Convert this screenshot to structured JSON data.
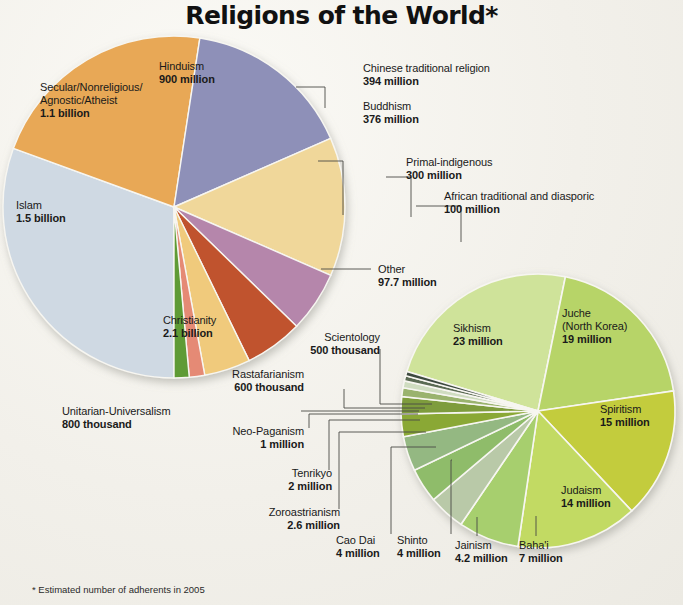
{
  "title": "Religions of the World*",
  "footnote": "* Estimated number of adherents in 2005",
  "chart_data": {
    "type": "pie",
    "title": "Religions of the World*",
    "subtitle": "* Estimated number of adherents in 2005",
    "unit": "adherents",
    "legend_position": "labels-on-slices-and-callouts",
    "charts": [
      {
        "name": "main-pie",
        "slices": [
          {
            "label": "Christianity",
            "value_text": "2.1 billion",
            "value": 2100000000,
            "color": "#cfd9e3"
          },
          {
            "label": "Islam",
            "value_text": "1.5 billion",
            "value": 1500000000,
            "color": "#e8a857"
          },
          {
            "label": "Secular/Nonreligious/Agnostic/Atheist",
            "value_text": "1.1 billion",
            "value": 1100000000,
            "color": "#8e90b8"
          },
          {
            "label": "Hinduism",
            "value_text": "900 million",
            "value": 900000000,
            "color": "#f0d79a"
          },
          {
            "label": "Chinese traditional religion",
            "value_text": "394 million",
            "value": 394000000,
            "color": "#b586ab"
          },
          {
            "label": "Buddhism",
            "value_text": "376 million",
            "value": 376000000,
            "color": "#c0522f"
          },
          {
            "label": "Primal-indigenous",
            "value_text": "300 million",
            "value": 300000000,
            "color": "#f0ca7c"
          },
          {
            "label": "African traditional and diasporic",
            "value_text": "100 million",
            "value": 100000000,
            "color": "#e58a75"
          },
          {
            "label": "Other",
            "value_text": "97.7 million",
            "value": 97700000,
            "color": "#5f9b34"
          }
        ]
      },
      {
        "name": "other-detail-pie",
        "note": "Breakdown of the Other slice",
        "slices": [
          {
            "label": "Sikhism",
            "value_text": "23 million",
            "value": 23000000,
            "color": "#cfe39a"
          },
          {
            "label": "Juche (North Korea)",
            "value_text": "19 million",
            "value": 19000000,
            "color": "#b7d468"
          },
          {
            "label": "Spiritism",
            "value_text": "15 million",
            "value": 15000000,
            "color": "#c3cc3c"
          },
          {
            "label": "Judaism",
            "value_text": "14 million",
            "value": 14000000,
            "color": "#c2da63"
          },
          {
            "label": "Baha'i",
            "value_text": "7 million",
            "value": 7000000,
            "color": "#a7cf6e"
          },
          {
            "label": "Jainism",
            "value_text": "4.2 million",
            "value": 4200000,
            "color": "#b9c9a8"
          },
          {
            "label": "Shinto",
            "value_text": "4 million",
            "value": 4000000,
            "color": "#8fbc6a"
          },
          {
            "label": "Cao Dai",
            "value_text": "4 million",
            "value": 4000000,
            "color": "#94b882"
          },
          {
            "label": "Zoroastrianism",
            "value_text": "2.6 million",
            "value": 2600000,
            "color": "#8aa836"
          },
          {
            "label": "Tenrikyo",
            "value_text": "2 million",
            "value": 2000000,
            "color": "#7e9c3c"
          },
          {
            "label": "Neo-Paganism",
            "value_text": "1 million",
            "value": 1000000,
            "color": "#9ab36e"
          },
          {
            "label": "Unitarian-Universalism",
            "value_text": "800 thousand",
            "value": 800000,
            "color": "#cfdcc0"
          },
          {
            "label": "Rastafarianism",
            "value_text": "600 thousand",
            "value": 600000,
            "color": "#5a6a52"
          },
          {
            "label": "Scientology",
            "value_text": "500 thousand",
            "value": 500000,
            "color": "#3e4a40"
          }
        ]
      }
    ]
  },
  "main_labels": {
    "hinduism": {
      "name": "Hinduism",
      "value": "900 million"
    },
    "secular": {
      "name_line1": "Secular/Nonreligious/",
      "name_line2": "Agnostic/Atheist",
      "value": "1.1 billion"
    },
    "islam": {
      "name": "Islam",
      "value": "1.5 billion"
    },
    "christianity": {
      "name": "Christianity",
      "value": "2.1 billion"
    },
    "chinese": {
      "name": "Chinese traditional religion",
      "value": "394 million"
    },
    "buddhism": {
      "name": "Buddhism",
      "value": "376 million"
    },
    "primal": {
      "name": "Primal-indigenous",
      "value": "300 million"
    },
    "african": {
      "name": "African traditional and diasporic",
      "value": "100 million"
    },
    "other": {
      "name": "Other",
      "value": "97.7 million"
    }
  },
  "detail_labels": {
    "sikhism": {
      "name": "Sikhism",
      "value": "23 million"
    },
    "juche": {
      "name_line1": "Juche",
      "name_line2": "(North Korea)",
      "value": "19 million"
    },
    "spiritism": {
      "name": "Spiritism",
      "value": "15 million"
    },
    "judaism": {
      "name": "Judaism",
      "value": "14 million"
    },
    "bahai": {
      "name": "Baha'i",
      "value": "7 million"
    },
    "jainism": {
      "name": "Jainism",
      "value": "4.2 million"
    },
    "shinto": {
      "name": "Shinto",
      "value": "4 million"
    },
    "caodai": {
      "name": "Cao Dai",
      "value": "4 million"
    },
    "zoroastrianism": {
      "name": "Zoroastrianism",
      "value": "2.6 million"
    },
    "tenrikyo": {
      "name": "Tenrikyo",
      "value": "2 million"
    },
    "neopaganism": {
      "name": "Neo-Paganism",
      "value": "1 million"
    },
    "unitarian": {
      "name": "Unitarian-Universalism",
      "value": "800 thousand"
    },
    "rastafarianism": {
      "name": "Rastafarianism",
      "value": "600 thousand"
    },
    "scientology": {
      "name": "Scientology",
      "value": "500 thousand"
    }
  }
}
